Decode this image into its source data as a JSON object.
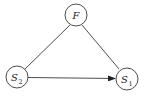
{
  "diagram": {
    "type": "directed-graph",
    "nodes": [
      {
        "id": "F",
        "label": "F",
        "subscript": ""
      },
      {
        "id": "S2",
        "label": "S",
        "subscript": "2"
      },
      {
        "id": "S1",
        "label": "S",
        "subscript": "1"
      }
    ],
    "edges": [
      {
        "from": "F",
        "to": "S2",
        "directed": false
      },
      {
        "from": "F",
        "to": "S1",
        "directed": false
      },
      {
        "from": "S2",
        "to": "S1",
        "directed": true
      }
    ],
    "colors": {
      "stroke": "#3a3a3a",
      "text": "#222222",
      "background": "#ffffff"
    }
  }
}
